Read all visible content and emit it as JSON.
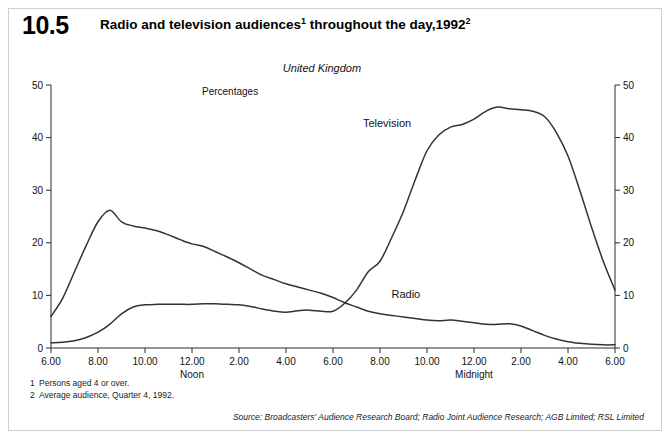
{
  "header": {
    "number": "10.5",
    "title_part1": "Radio and television audiences",
    "title_sup1": "1",
    "title_part2": " throughout the day,1992",
    "title_sup2": "2",
    "title_full": "Radio and television audiences¹ throughout the day,1992²"
  },
  "footnotes": [
    {
      "num": "1",
      "text": "Persons aged 4 or over."
    },
    {
      "num": "2",
      "text": "Average audience, Quarter 4, 1992."
    }
  ],
  "source": "Source: Broadcasters' Audience Research Board; Radio Joint Audience Research; AGB Limited; RSL Limited",
  "colors": {
    "line": "#333333",
    "axis": "#2a2a2a",
    "frame": "#cfcfcf",
    "background": "#ffffff"
  },
  "chart_data": {
    "type": "line",
    "subtitle": "United Kingdom",
    "units": "Percentages",
    "xlabel": "",
    "ylabel": "",
    "ylim": [
      0,
      50
    ],
    "yticks": [
      0,
      10,
      20,
      30,
      40,
      50
    ],
    "ytick_labels": [
      "0",
      "10",
      "20",
      "30",
      "40",
      "50"
    ],
    "y_axis_both_sides": true,
    "grid": false,
    "legend_position": "inline-annotations",
    "xlim": [
      6,
      30
    ],
    "xticks": [
      6,
      8,
      10,
      12,
      14,
      16,
      18,
      20,
      22,
      24,
      26,
      28,
      30
    ],
    "xtick_labels": [
      "6.00",
      "8.00",
      "10.00",
      "12.00",
      "2.00",
      "4.00",
      "6.00",
      "8.00",
      "10.00",
      "12.00",
      "2.00",
      "4.00",
      "6.00"
    ],
    "x_period_labels": [
      {
        "at": 12,
        "text": "Noon"
      },
      {
        "at": 24,
        "text": "Midnight"
      }
    ],
    "annotations": [
      {
        "text": "Television",
        "x": 20.3,
        "y": 42.0
      },
      {
        "text": "Radio",
        "x": 21.1,
        "y": 9.5
      }
    ],
    "x": [
      6.0,
      6.5,
      7.0,
      7.5,
      8.0,
      8.5,
      9.0,
      9.5,
      10.0,
      10.5,
      11.0,
      11.5,
      12.0,
      12.5,
      13.0,
      13.5,
      14.0,
      14.5,
      15.0,
      15.5,
      16.0,
      16.5,
      17.0,
      17.5,
      18.0,
      18.5,
      19.0,
      19.5,
      20.0,
      20.5,
      21.0,
      21.5,
      22.0,
      22.5,
      23.0,
      23.5,
      24.0,
      24.5,
      25.0,
      25.5,
      26.0,
      26.5,
      27.0,
      27.5,
      28.0,
      28.5,
      29.0,
      29.5,
      30.0
    ],
    "series": [
      {
        "name": "Radio",
        "values": [
          6.0,
          9.5,
          14.5,
          19.5,
          24.0,
          26.2,
          24.0,
          23.2,
          22.8,
          22.3,
          21.5,
          20.6,
          19.8,
          19.3,
          18.3,
          17.3,
          16.2,
          15.0,
          13.8,
          13.0,
          12.2,
          11.6,
          11.0,
          10.4,
          9.6,
          8.6,
          7.8,
          7.0,
          6.5,
          6.2,
          5.9,
          5.6,
          5.3,
          5.2,
          5.3,
          5.1,
          4.8,
          4.5,
          4.5,
          4.6,
          4.2,
          3.3,
          2.4,
          1.7,
          1.2,
          0.9,
          0.7,
          0.6,
          0.6
        ]
      },
      {
        "name": "Television",
        "values": [
          1.0,
          1.1,
          1.4,
          2.0,
          3.0,
          4.5,
          6.5,
          7.8,
          8.2,
          8.3,
          8.3,
          8.3,
          8.3,
          8.4,
          8.4,
          8.3,
          8.2,
          7.9,
          7.4,
          7.0,
          6.8,
          7.1,
          7.2,
          7.0,
          7.0,
          8.5,
          11.0,
          14.5,
          16.5,
          21.0,
          26.0,
          32.0,
          37.5,
          40.5,
          42.0,
          42.5,
          43.5,
          45.0,
          45.8,
          45.5,
          45.3,
          45.0,
          44.0,
          41.0,
          36.5,
          30.0,
          23.0,
          16.5,
          11.0
        ]
      }
    ],
    "note": "Radio and Television series are plotted against a shared 24-hour axis starting at 6.00 am. Values are percentages of persons aged 4 or over, average audience, Quarter 4 1992."
  }
}
